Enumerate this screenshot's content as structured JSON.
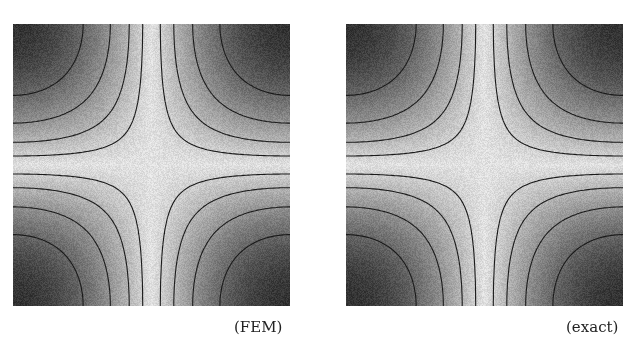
{
  "figure": {
    "panels": [
      {
        "id": "fem",
        "caption": "(FEM)"
      },
      {
        "id": "exact",
        "caption": "(exact)"
      }
    ]
  },
  "chart_data": [
    {
      "type": "heatmap",
      "title": "(FEM)",
      "function": "|cos(pi x) * cos(pi y)|",
      "domain": {
        "x": [
          0,
          1
        ],
        "y": [
          0,
          1
        ]
      },
      "colormap": "grayscale, dark = high, light = low",
      "contour_levels": [
        0.1,
        0.25,
        0.45,
        0.7
      ],
      "xlabel": "",
      "ylabel": ""
    },
    {
      "type": "heatmap",
      "title": "(exact)",
      "function": "|cos(pi x) * cos(pi y)|",
      "domain": {
        "x": [
          0,
          1
        ],
        "y": [
          0,
          1
        ]
      },
      "colormap": "grayscale, dark = high, light = low",
      "contour_levels": [
        0.1,
        0.25,
        0.45,
        0.7
      ],
      "xlabel": "",
      "ylabel": ""
    }
  ]
}
